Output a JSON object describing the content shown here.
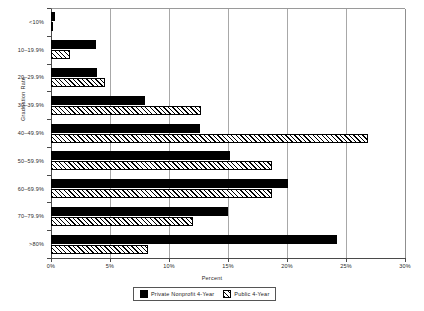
{
  "chart_data": {
    "type": "bar",
    "orientation": "horizontal",
    "title": "",
    "xlabel": "Percent",
    "ylabel": "Graduation Rate",
    "categories": [
      "<10%",
      "10–19.9%",
      "20–29.9%",
      "30–39.9%",
      "40–49.9%",
      "50–59.9%",
      "60–69.9%",
      "70–79.9%",
      ">80%"
    ],
    "series": [
      {
        "name": "Private Nonprofit 4-Year",
        "style": "solid",
        "values": [
          0.3,
          3.8,
          3.9,
          8.0,
          12.6,
          15.2,
          20.1,
          15.0,
          24.2
        ]
      },
      {
        "name": "Public 4-Year",
        "style": "hatch",
        "values": [
          0.1,
          1.6,
          4.6,
          12.7,
          26.9,
          18.7,
          18.7,
          12.0,
          8.2
        ]
      }
    ],
    "xlim": [
      0,
      30
    ],
    "xticks": [
      0,
      5,
      10,
      15,
      20,
      25,
      30
    ],
    "xtick_labels": [
      "0%",
      "5%",
      "10%",
      "15%",
      "20%",
      "25%",
      "30%"
    ],
    "grid": "vertical",
    "legend_position": "bottom"
  },
  "legend": {
    "items": [
      {
        "label": "Private Nonprofit 4-Year",
        "style": "solid"
      },
      {
        "label": "Public 4-Year",
        "style": "hatch"
      }
    ]
  }
}
